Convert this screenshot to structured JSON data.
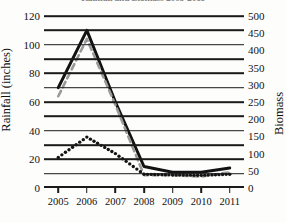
{
  "chart_data": {
    "type": "line",
    "title": "Rainfall and Biomass 2005-2011",
    "xlabel": "",
    "ylabel": "Rainfall (inches)",
    "y2label": "Biomass",
    "categories": [
      "2005",
      "2006",
      "2007",
      "2008",
      "2009",
      "2010",
      "2011"
    ],
    "x": [
      2005,
      2006,
      2007,
      2008,
      2009,
      2010,
      2011
    ],
    "ylim": [
      0,
      120
    ],
    "ytick_labels": [
      "0",
      "20",
      "40",
      "60",
      "80",
      "100",
      "120"
    ],
    "ytick_values": [
      0,
      20,
      40,
      60,
      80,
      100,
      120
    ],
    "y2lim": [
      0,
      500
    ],
    "y2tick_labels": [
      "0",
      "50",
      "100",
      "150",
      "200",
      "250",
      "300",
      "350",
      "400",
      "450",
      "500"
    ],
    "y2tick_values": [
      0,
      50,
      100,
      150,
      200,
      250,
      300,
      350,
      400,
      450,
      500
    ],
    "gridlines": [
      10,
      20,
      30,
      40,
      50,
      60,
      70,
      80,
      90,
      100,
      110,
      120
    ],
    "grid": true,
    "legend": "none",
    "series": [
      {
        "name": "rainfall-solid",
        "axis": "left",
        "style": "solid",
        "color": "#121212",
        "values": [
          70,
          110,
          60,
          15,
          11,
          11,
          14
        ]
      },
      {
        "name": "rainfall-dashed",
        "axis": "left",
        "style": "dashed",
        "color": "#9a9a9a",
        "values": [
          64,
          104,
          58,
          9,
          9,
          8,
          11
        ]
      },
      {
        "name": "biomass-dotted",
        "axis": "right",
        "style": "dotted",
        "color": "#121212",
        "values": [
          89,
          148,
          100,
          40,
          38,
          37,
          40
        ]
      }
    ]
  }
}
